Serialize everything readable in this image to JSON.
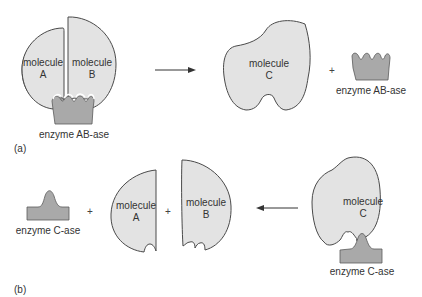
{
  "panel_a": {
    "label": "(a)",
    "reactants": {
      "molecule_a": {
        "line1": "molecule",
        "line2": "A"
      },
      "molecule_b": {
        "line1": "molecule",
        "line2": "B"
      },
      "enzyme_caption": "enzyme AB-ase"
    },
    "arrow_direction": "right",
    "products": {
      "molecule_c": {
        "line1": "molecule",
        "line2": "C"
      },
      "plus": "+",
      "enzyme_caption": "enzyme AB-ase"
    }
  },
  "panel_b": {
    "label": "(b)",
    "reactants": {
      "molecule_c": {
        "line1": "molecule",
        "line2": "C"
      },
      "enzyme_caption": "enzyme C-ase"
    },
    "arrow_direction": "left",
    "products": {
      "enzyme_caption": "enzyme C-ase",
      "plus_1": "+",
      "molecule_a": {
        "line1": "molecule",
        "line2": "A"
      },
      "plus_2": "+",
      "molecule_b": {
        "line1": "molecule",
        "line2": "B"
      }
    }
  },
  "colors": {
    "molecule_fill": "#e3e3e3",
    "enzyme_fill": "#a9a9a9",
    "outline": "#4a4a4a",
    "text": "#333333"
  }
}
